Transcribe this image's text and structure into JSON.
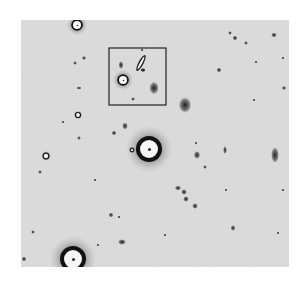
{
  "image": {
    "description": "Inverted grayscale astronomical deep-field image with stars and galaxies; a rectangular box highlights a region of interest near the upper center.",
    "background_color": "#d6d6d6",
    "object_color": "#1e1e1e",
    "box_color": "#222222",
    "frame": {
      "x": 21,
      "y": 20,
      "width": 268,
      "height": 247
    }
  },
  "highlight_box": {
    "x": 109,
    "y": 48,
    "width": 57,
    "height": 57,
    "label": "region of interest"
  },
  "bright_stars": [
    {
      "name": "star-top-left",
      "x": 77,
      "y": 25,
      "r": 4
    },
    {
      "name": "star-center",
      "x": 149,
      "y": 149,
      "r": 9
    },
    {
      "name": "star-bottom-left",
      "x": 73,
      "y": 259,
      "r": 9
    },
    {
      "name": "star-in-box",
      "x": 123,
      "y": 80,
      "r": 4
    }
  ],
  "ring_objects": [
    {
      "x": 78,
      "y": 115,
      "r": 2.5
    },
    {
      "x": 46,
      "y": 156,
      "r": 2.8
    },
    {
      "x": 132,
      "y": 150,
      "r": 1.8
    }
  ],
  "faint_objects": [
    {
      "x": 121,
      "y": 65,
      "rx": 1.5,
      "ry": 2.5
    },
    {
      "x": 154,
      "y": 88,
      "rx": 3,
      "ry": 4
    },
    {
      "x": 133,
      "y": 99,
      "rx": 1.2,
      "ry": 1.2
    },
    {
      "x": 185,
      "y": 105,
      "rx": 4,
      "ry": 5
    },
    {
      "x": 84,
      "y": 58,
      "rx": 1.3,
      "ry": 1.3
    },
    {
      "x": 75,
      "y": 63,
      "rx": 1.2,
      "ry": 1.2
    },
    {
      "x": 79,
      "y": 88,
      "rx": 1.5,
      "ry": 1
    },
    {
      "x": 63,
      "y": 122,
      "rx": 1,
      "ry": 1
    },
    {
      "x": 79,
      "y": 138,
      "rx": 1.2,
      "ry": 1.2
    },
    {
      "x": 40,
      "y": 172,
      "rx": 1.2,
      "ry": 1.2
    },
    {
      "x": 125,
      "y": 126,
      "rx": 1.8,
      "ry": 2.2
    },
    {
      "x": 114,
      "y": 133,
      "rx": 1.6,
      "ry": 1.4
    },
    {
      "x": 197,
      "y": 155,
      "rx": 2,
      "ry": 2.5
    },
    {
      "x": 225,
      "y": 150,
      "rx": 1.2,
      "ry": 2.5
    },
    {
      "x": 205,
      "y": 167,
      "rx": 1.2,
      "ry": 1.2
    },
    {
      "x": 275,
      "y": 155,
      "rx": 2.5,
      "ry": 5
    },
    {
      "x": 230,
      "y": 33,
      "rx": 1.2,
      "ry": 1.2
    },
    {
      "x": 235,
      "y": 38,
      "rx": 1.5,
      "ry": 1.5
    },
    {
      "x": 246,
      "y": 43,
      "rx": 1.2,
      "ry": 1.2
    },
    {
      "x": 274,
      "y": 35,
      "rx": 1.8,
      "ry": 1.5
    },
    {
      "x": 256,
      "y": 62,
      "rx": 1,
      "ry": 1
    },
    {
      "x": 219,
      "y": 70,
      "rx": 1.5,
      "ry": 1.5
    },
    {
      "x": 284,
      "y": 88,
      "rx": 1.3,
      "ry": 1.3
    },
    {
      "x": 283,
      "y": 58,
      "rx": 1,
      "ry": 1
    },
    {
      "x": 178,
      "y": 188,
      "rx": 2,
      "ry": 1.5
    },
    {
      "x": 184,
      "y": 192,
      "rx": 1.8,
      "ry": 1.8
    },
    {
      "x": 186,
      "y": 199,
      "rx": 1.8,
      "ry": 1.8
    },
    {
      "x": 195,
      "y": 206,
      "rx": 1.8,
      "ry": 1.8
    },
    {
      "x": 111,
      "y": 215,
      "rx": 1.5,
      "ry": 1.5
    },
    {
      "x": 119,
      "y": 217,
      "rx": 1,
      "ry": 1
    },
    {
      "x": 122,
      "y": 242,
      "rx": 2.5,
      "ry": 1.8
    },
    {
      "x": 98,
      "y": 245,
      "rx": 1,
      "ry": 1
    },
    {
      "x": 33,
      "y": 232,
      "rx": 1.2,
      "ry": 1.2
    },
    {
      "x": 24,
      "y": 259,
      "rx": 1.5,
      "ry": 1.5
    },
    {
      "x": 233,
      "y": 228,
      "rx": 1.5,
      "ry": 1.8
    },
    {
      "x": 278,
      "y": 233,
      "rx": 1,
      "ry": 1
    },
    {
      "x": 226,
      "y": 190,
      "rx": 1,
      "ry": 1
    },
    {
      "x": 283,
      "y": 190,
      "rx": 1,
      "ry": 1
    },
    {
      "x": 165,
      "y": 235,
      "rx": 1,
      "ry": 1
    },
    {
      "x": 142,
      "y": 50,
      "rx": 1,
      "ry": 1
    },
    {
      "x": 254,
      "y": 100,
      "rx": 1,
      "ry": 1
    },
    {
      "x": 95,
      "y": 180,
      "rx": 1,
      "ry": 1
    },
    {
      "x": 196,
      "y": 143,
      "rx": 1,
      "ry": 1
    }
  ]
}
